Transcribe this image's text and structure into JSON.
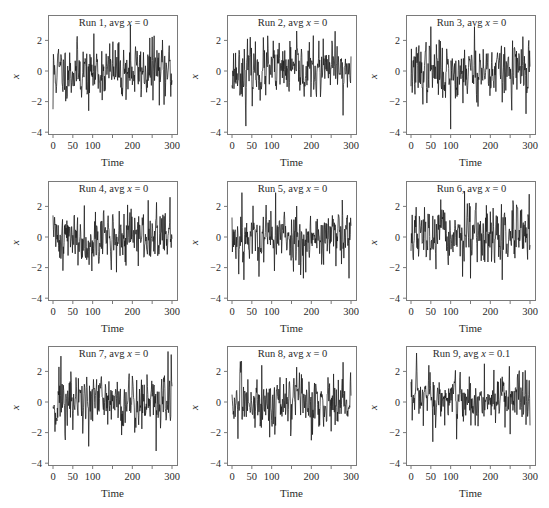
{
  "figure": {
    "panels_layout": {
      "rows": 3,
      "cols": 3
    }
  },
  "chart_data": [
    {
      "type": "line",
      "title_prefix": "Run 1, avg ",
      "title_var": "x",
      "title_suffix": " = 0",
      "xlabel": "Time",
      "ylabel": "x",
      "xlim": [
        0,
        300
      ],
      "ylim": [
        -4,
        3.5
      ],
      "xticks": [
        0,
        50,
        100,
        200,
        300
      ],
      "xtick_marks": [
        0,
        50,
        100,
        150,
        200,
        250,
        300
      ],
      "yticks": [
        -4,
        -2,
        0,
        2
      ],
      "n_points": 300,
      "avg": 0,
      "seed": 11,
      "amp": 0.9,
      "notable": [
        [
          0,
          -2.5
        ],
        [
          90,
          -2.6
        ],
        [
          195,
          3.0
        ],
        [
          255,
          2.3
        ],
        [
          280,
          -2.2
        ]
      ],
      "grid": false
    },
    {
      "type": "line",
      "title_prefix": "Run 2, avg ",
      "title_var": "x",
      "title_suffix": " = 0",
      "xlabel": "Time",
      "ylabel": "x",
      "xlim": [
        0,
        300
      ],
      "ylim": [
        -4,
        3.5
      ],
      "xticks": [
        0,
        50,
        100,
        200,
        300
      ],
      "xtick_marks": [
        0,
        50,
        100,
        150,
        200,
        250,
        300
      ],
      "yticks": [
        -4,
        -2,
        0,
        2
      ],
      "n_points": 300,
      "avg": 0,
      "seed": 23,
      "amp": 0.85,
      "notable": [
        [
          35,
          -3.6
        ],
        [
          90,
          2.3
        ],
        [
          260,
          2.6
        ],
        [
          280,
          -2.9
        ]
      ],
      "grid": false
    },
    {
      "type": "line",
      "title_prefix": "Run 3, avg ",
      "title_var": "x",
      "title_suffix": " = 0",
      "xlabel": "Time",
      "ylabel": "x",
      "xlim": [
        0,
        300
      ],
      "ylim": [
        -4,
        3.5
      ],
      "xticks": [
        0,
        50,
        100,
        200,
        300
      ],
      "xtick_marks": [
        0,
        50,
        100,
        150,
        200,
        250,
        300
      ],
      "yticks": [
        -4,
        -2,
        0,
        2
      ],
      "n_points": 300,
      "avg": 0,
      "seed": 37,
      "amp": 0.9,
      "notable": [
        [
          50,
          2.9
        ],
        [
          100,
          -3.8
        ],
        [
          160,
          2.9
        ],
        [
          290,
          -2.8
        ]
      ],
      "grid": false
    },
    {
      "type": "line",
      "title_prefix": "Run 4, avg ",
      "title_var": "x",
      "title_suffix": " = 0",
      "xlabel": "Time",
      "ylabel": "x",
      "xlim": [
        0,
        300
      ],
      "ylim": [
        -4,
        3.5
      ],
      "xticks": [
        0,
        50,
        100,
        200,
        300
      ],
      "xtick_marks": [
        0,
        50,
        100,
        150,
        200,
        250,
        300
      ],
      "yticks": [
        -4,
        -2,
        0,
        2
      ],
      "n_points": 300,
      "avg": 0,
      "seed": 41,
      "amp": 0.85,
      "notable": [
        [
          25,
          -2.2
        ],
        [
          160,
          2.6
        ],
        [
          160,
          -2.3
        ],
        [
          240,
          2.4
        ],
        [
          295,
          2.6
        ]
      ],
      "grid": false
    },
    {
      "type": "line",
      "title_prefix": "Run 5, avg ",
      "title_var": "x",
      "title_suffix": " = 0",
      "xlabel": "Time",
      "ylabel": "x",
      "xlim": [
        0,
        300
      ],
      "ylim": [
        -4,
        3.5
      ],
      "xticks": [
        0,
        50,
        100,
        200,
        300
      ],
      "xtick_marks": [
        0,
        50,
        100,
        150,
        200,
        250,
        300
      ],
      "yticks": [
        -4,
        -2,
        0,
        2
      ],
      "n_points": 300,
      "avg": 0,
      "seed": 53,
      "amp": 0.9,
      "notable": [
        [
          25,
          2.9
        ],
        [
          30,
          -2.8
        ],
        [
          110,
          2.9
        ],
        [
          180,
          -2.7
        ],
        [
          295,
          -2.7
        ]
      ],
      "grid": false
    },
    {
      "type": "line",
      "title_prefix": "Run 6, avg ",
      "title_var": "x",
      "title_suffix": " = 0",
      "xlabel": "Time",
      "ylabel": "x",
      "xlim": [
        0,
        300
      ],
      "ylim": [
        -4,
        3.5
      ],
      "xticks": [
        0,
        50,
        100,
        200,
        300
      ],
      "xtick_marks": [
        0,
        50,
        100,
        150,
        200,
        250,
        300
      ],
      "yticks": [
        -4,
        -2,
        0,
        2
      ],
      "n_points": 300,
      "avg": 0,
      "seed": 67,
      "amp": 0.9,
      "notable": [
        [
          135,
          3.0
        ],
        [
          150,
          -2.7
        ],
        [
          230,
          -2.8
        ],
        [
          298,
          2.8
        ]
      ],
      "grid": false
    },
    {
      "type": "line",
      "title_prefix": "Run 7, avg ",
      "title_var": "x",
      "title_suffix": " = 0",
      "xlabel": "Time",
      "ylabel": "x",
      "xlim": [
        0,
        300
      ],
      "ylim": [
        -4,
        3.5
      ],
      "xticks": [
        0,
        50,
        100,
        200,
        300
      ],
      "xtick_marks": [
        0,
        50,
        100,
        150,
        200,
        250,
        300
      ],
      "yticks": [
        -4,
        -2,
        0,
        2
      ],
      "n_points": 300,
      "avg": 0,
      "seed": 71,
      "amp": 0.95,
      "notable": [
        [
          20,
          3.0
        ],
        [
          90,
          -2.9
        ],
        [
          260,
          -3.2
        ],
        [
          290,
          3.3
        ],
        [
          298,
          3.1
        ]
      ],
      "grid": false
    },
    {
      "type": "line",
      "title_prefix": "Run 8, avg ",
      "title_var": "x",
      "title_suffix": " = 0",
      "xlabel": "Time",
      "ylabel": "x",
      "xlim": [
        0,
        300
      ],
      "ylim": [
        -4,
        3.5
      ],
      "xticks": [
        0,
        50,
        100,
        200,
        300
      ],
      "xtick_marks": [
        0,
        50,
        100,
        150,
        200,
        250,
        300
      ],
      "yticks": [
        -4,
        -2,
        0,
        2
      ],
      "n_points": 300,
      "avg": 0,
      "seed": 83,
      "amp": 0.85,
      "notable": [
        [
          15,
          -2.4
        ],
        [
          75,
          2.4
        ],
        [
          95,
          -2.3
        ],
        [
          200,
          -2.5
        ],
        [
          280,
          2.6
        ]
      ],
      "grid": false
    },
    {
      "type": "line",
      "title_prefix": "Run 9, avg ",
      "title_var": "x",
      "title_suffix": " = 0.1",
      "xlabel": "Time",
      "ylabel": "x",
      "xlim": [
        0,
        300
      ],
      "ylim": [
        -4,
        3.5
      ],
      "xticks": [
        0,
        50,
        100,
        200,
        300
      ],
      "xtick_marks": [
        0,
        50,
        100,
        150,
        200,
        250,
        300
      ],
      "yticks": [
        -4,
        -2,
        0,
        2
      ],
      "n_points": 300,
      "avg": 0.1,
      "seed": 97,
      "amp": 0.85,
      "notable": [
        [
          45,
          2.4
        ],
        [
          55,
          -2.6
        ],
        [
          185,
          2.5
        ],
        [
          250,
          -2.1
        ]
      ],
      "grid": false
    }
  ],
  "style": {
    "line_color": "#1a1a1a",
    "frame_color": "#7a7a7a",
    "text_color": "#2a2a2a"
  }
}
